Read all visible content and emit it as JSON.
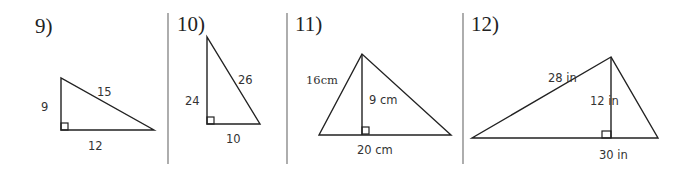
{
  "worksheet": {
    "problems": [
      {
        "number": "9)",
        "type": "right-triangle",
        "labels": {
          "left_leg": "9",
          "hypotenuse": "15",
          "base": "12"
        }
      },
      {
        "number": "10)",
        "type": "right-triangle",
        "labels": {
          "left_leg": "24",
          "hypotenuse": "26",
          "base": "10"
        }
      },
      {
        "number": "11)",
        "type": "triangle-with-height",
        "labels": {
          "left_side_value": "16",
          "left_side_unit": "cm",
          "height": "9 cm",
          "base": "20 cm"
        }
      },
      {
        "number": "12)",
        "type": "triangle-with-height",
        "labels": {
          "left_side": "28 in",
          "height": "12 in",
          "base": "30 in"
        }
      }
    ],
    "colors": {
      "line": "#222222",
      "separator": "#777777",
      "text": "#333333",
      "background": "#ffffff"
    }
  }
}
